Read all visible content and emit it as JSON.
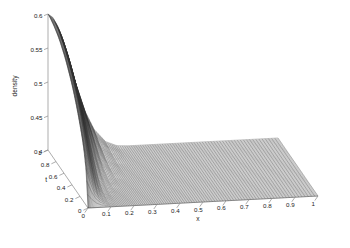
{
  "figure": {
    "background_color": "#ffffff",
    "mesh_color": "#303030",
    "axis_color": "#8a8a8a",
    "text_color": "#1a1a1a",
    "width": 350,
    "height": 248
  },
  "chart_data": {
    "type": "surface",
    "title": "",
    "xlabel": "x",
    "ylabel": "t",
    "zlabel": "density",
    "grid": false,
    "legend": null,
    "xlim": [
      0,
      1
    ],
    "ylim": [
      0,
      1
    ],
    "zlim": [
      0.4,
      0.6
    ],
    "xticks": [
      "0",
      "0.1",
      "0.2",
      "0.3",
      "0.4",
      "0.5",
      "0.6",
      "0.7",
      "0.8",
      "0.9",
      "1"
    ],
    "xtick_values": [
      0,
      0.1,
      0.2,
      0.3,
      0.4,
      0.5,
      0.6,
      0.7,
      0.8,
      0.9,
      1
    ],
    "yticks": [
      "0",
      "0.2",
      "0.4",
      "0.6",
      "0.8",
      "1"
    ],
    "ytick_values": [
      0,
      0.2,
      0.4,
      0.6,
      0.8,
      1
    ],
    "zticks": [
      "0.4",
      "0.45",
      "0.5",
      "0.55",
      "0.6"
    ],
    "ztick_values": [
      0.4,
      0.45,
      0.5,
      0.55,
      0.6
    ],
    "surface_description": "Mesh surface of density over x and t. A tall rounded ridge rises near x=0 for large t up to density 0.60, falls through a steep narrow fold near x=0.05-0.10, then flattens to a broad plateau at density 0.40 for x greater than about 0.3.",
    "x_samples": [
      0,
      0.02,
      0.04,
      0.06,
      0.08,
      0.1,
      0.13,
      0.16,
      0.2,
      0.25,
      0.3,
      0.35,
      0.4,
      0.45,
      0.5,
      0.55,
      0.6,
      0.65,
      0.7,
      0.75,
      0.8,
      0.85,
      0.9,
      0.95,
      1
    ],
    "t_samples": [
      0,
      0.05,
      0.1,
      0.15,
      0.2,
      0.25,
      0.3,
      0.35,
      0.4,
      0.45,
      0.5,
      0.55,
      0.6,
      0.65,
      0.7,
      0.75,
      0.8,
      0.85,
      0.9,
      0.95,
      1
    ],
    "z_surface": [
      [
        0.4,
        0.4,
        0.4,
        0.4,
        0.4,
        0.4,
        0.4,
        0.4,
        0.4,
        0.4,
        0.4,
        0.4,
        0.4,
        0.4,
        0.4,
        0.4,
        0.4,
        0.4,
        0.4,
        0.4,
        0.4,
        0.4,
        0.4,
        0.4,
        0.4
      ],
      [
        0.452,
        0.43,
        0.414,
        0.406,
        0.402,
        0.4,
        0.4,
        0.4,
        0.4,
        0.4,
        0.4,
        0.4,
        0.4,
        0.4,
        0.4,
        0.4,
        0.4,
        0.4,
        0.4,
        0.4,
        0.4,
        0.4,
        0.4,
        0.4,
        0.4
      ],
      [
        0.476,
        0.452,
        0.428,
        0.412,
        0.404,
        0.401,
        0.4,
        0.4,
        0.4,
        0.4,
        0.4,
        0.4,
        0.4,
        0.4,
        0.4,
        0.4,
        0.4,
        0.4,
        0.4,
        0.4,
        0.4,
        0.4,
        0.4,
        0.4,
        0.4
      ],
      [
        0.492,
        0.47,
        0.442,
        0.42,
        0.408,
        0.402,
        0.4,
        0.4,
        0.4,
        0.4,
        0.4,
        0.4,
        0.4,
        0.4,
        0.4,
        0.4,
        0.4,
        0.4,
        0.4,
        0.4,
        0.4,
        0.4,
        0.4,
        0.4,
        0.4
      ],
      [
        0.505,
        0.485,
        0.456,
        0.43,
        0.413,
        0.404,
        0.4,
        0.4,
        0.4,
        0.4,
        0.4,
        0.4,
        0.4,
        0.4,
        0.4,
        0.4,
        0.4,
        0.4,
        0.4,
        0.4,
        0.4,
        0.4,
        0.4,
        0.4,
        0.4
      ],
      [
        0.517,
        0.498,
        0.47,
        0.441,
        0.42,
        0.408,
        0.401,
        0.4,
        0.4,
        0.4,
        0.4,
        0.4,
        0.4,
        0.4,
        0.4,
        0.4,
        0.4,
        0.4,
        0.4,
        0.4,
        0.4,
        0.4,
        0.4,
        0.4,
        0.4
      ],
      [
        0.528,
        0.51,
        0.483,
        0.453,
        0.429,
        0.413,
        0.403,
        0.4,
        0.4,
        0.4,
        0.4,
        0.4,
        0.4,
        0.4,
        0.4,
        0.4,
        0.4,
        0.4,
        0.4,
        0.4,
        0.4,
        0.4,
        0.4,
        0.4,
        0.4
      ],
      [
        0.538,
        0.521,
        0.495,
        0.465,
        0.439,
        0.42,
        0.406,
        0.401,
        0.4,
        0.4,
        0.4,
        0.4,
        0.4,
        0.4,
        0.4,
        0.4,
        0.4,
        0.4,
        0.4,
        0.4,
        0.4,
        0.4,
        0.4,
        0.4,
        0.4
      ],
      [
        0.547,
        0.531,
        0.506,
        0.476,
        0.45,
        0.428,
        0.41,
        0.402,
        0.4,
        0.4,
        0.4,
        0.4,
        0.4,
        0.4,
        0.4,
        0.4,
        0.4,
        0.4,
        0.4,
        0.4,
        0.4,
        0.4,
        0.4,
        0.4,
        0.4
      ],
      [
        0.555,
        0.54,
        0.516,
        0.487,
        0.46,
        0.437,
        0.415,
        0.404,
        0.4,
        0.4,
        0.4,
        0.4,
        0.4,
        0.4,
        0.4,
        0.4,
        0.4,
        0.4,
        0.4,
        0.4,
        0.4,
        0.4,
        0.4,
        0.4,
        0.4
      ],
      [
        0.562,
        0.548,
        0.525,
        0.497,
        0.47,
        0.446,
        0.421,
        0.407,
        0.401,
        0.4,
        0.4,
        0.4,
        0.4,
        0.4,
        0.4,
        0.4,
        0.4,
        0.4,
        0.4,
        0.4,
        0.4,
        0.4,
        0.4,
        0.4,
        0.4
      ],
      [
        0.569,
        0.556,
        0.534,
        0.507,
        0.48,
        0.455,
        0.428,
        0.411,
        0.402,
        0.4,
        0.4,
        0.4,
        0.4,
        0.4,
        0.4,
        0.4,
        0.4,
        0.4,
        0.4,
        0.4,
        0.4,
        0.4,
        0.4,
        0.4,
        0.4
      ],
      [
        0.575,
        0.563,
        0.542,
        0.516,
        0.489,
        0.464,
        0.435,
        0.415,
        0.403,
        0.4,
        0.4,
        0.4,
        0.4,
        0.4,
        0.4,
        0.4,
        0.4,
        0.4,
        0.4,
        0.4,
        0.4,
        0.4,
        0.4,
        0.4,
        0.4
      ],
      [
        0.58,
        0.569,
        0.549,
        0.524,
        0.498,
        0.472,
        0.442,
        0.42,
        0.405,
        0.4,
        0.4,
        0.4,
        0.4,
        0.4,
        0.4,
        0.4,
        0.4,
        0.4,
        0.4,
        0.4,
        0.4,
        0.4,
        0.4,
        0.4,
        0.4
      ],
      [
        0.585,
        0.575,
        0.556,
        0.532,
        0.506,
        0.48,
        0.449,
        0.425,
        0.407,
        0.4,
        0.4,
        0.4,
        0.4,
        0.4,
        0.4,
        0.4,
        0.4,
        0.4,
        0.4,
        0.4,
        0.4,
        0.4,
        0.4,
        0.4,
        0.4
      ],
      [
        0.589,
        0.58,
        0.562,
        0.539,
        0.514,
        0.487,
        0.456,
        0.43,
        0.41,
        0.401,
        0.4,
        0.4,
        0.4,
        0.4,
        0.4,
        0.4,
        0.4,
        0.4,
        0.4,
        0.4,
        0.4,
        0.4,
        0.4,
        0.4,
        0.4
      ],
      [
        0.592,
        0.584,
        0.567,
        0.546,
        0.521,
        0.494,
        0.463,
        0.435,
        0.413,
        0.402,
        0.4,
        0.4,
        0.4,
        0.4,
        0.4,
        0.4,
        0.4,
        0.4,
        0.4,
        0.4,
        0.4,
        0.4,
        0.4,
        0.4,
        0.4
      ],
      [
        0.595,
        0.588,
        0.572,
        0.552,
        0.528,
        0.501,
        0.469,
        0.44,
        0.416,
        0.403,
        0.4,
        0.4,
        0.4,
        0.4,
        0.4,
        0.4,
        0.4,
        0.4,
        0.4,
        0.4,
        0.4,
        0.4,
        0.4,
        0.4,
        0.4
      ],
      [
        0.597,
        0.591,
        0.577,
        0.557,
        0.534,
        0.507,
        0.475,
        0.445,
        0.42,
        0.405,
        0.4,
        0.4,
        0.4,
        0.4,
        0.4,
        0.4,
        0.4,
        0.4,
        0.4,
        0.4,
        0.4,
        0.4,
        0.4,
        0.4,
        0.4
      ],
      [
        0.599,
        0.593,
        0.58,
        0.562,
        0.539,
        0.513,
        0.481,
        0.45,
        0.423,
        0.406,
        0.4,
        0.4,
        0.4,
        0.4,
        0.4,
        0.4,
        0.4,
        0.4,
        0.4,
        0.4,
        0.4,
        0.4,
        0.4,
        0.4,
        0.4
      ],
      [
        0.6,
        0.595,
        0.583,
        0.566,
        0.544,
        0.518,
        0.486,
        0.455,
        0.427,
        0.408,
        0.401,
        0.4,
        0.4,
        0.4,
        0.4,
        0.4,
        0.4,
        0.4,
        0.4,
        0.4,
        0.4,
        0.4,
        0.4,
        0.4,
        0.4
      ]
    ]
  }
}
